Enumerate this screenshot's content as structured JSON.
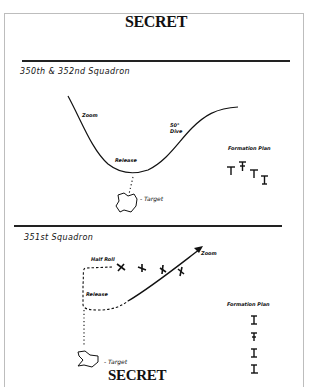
{
  "document": {
    "classification_top": "SECRET",
    "classification_bottom": "SECRET"
  },
  "section1": {
    "title": "350th & 352nd Squadron",
    "labels": {
      "start": "Zoom",
      "dive": "50° Dive",
      "release": "Release",
      "target": "- Target"
    },
    "formation": {
      "title": "Formation Plan",
      "aircraft_count": 4
    }
  },
  "section2": {
    "title": "351st Squadron",
    "labels": {
      "half_roll": "Half Roll",
      "release": "Release",
      "zoom": "Zoom",
      "target": "- Target"
    },
    "formation": {
      "title": "Formation Plan",
      "aircraft_count": 4
    }
  }
}
